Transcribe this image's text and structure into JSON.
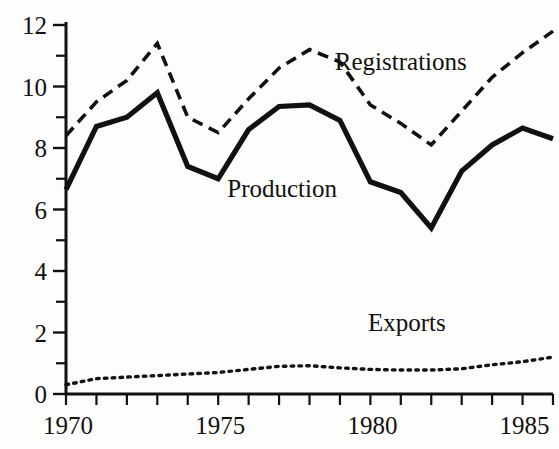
{
  "chart_data": {
    "type": "line",
    "title": "",
    "subtitle": "",
    "xlabel": "",
    "ylabel": "",
    "xlim": [
      1970,
      1986
    ],
    "ylim": [
      0,
      12
    ],
    "grid": false,
    "legend_position": "inline-annotations",
    "x": [
      1970,
      1971,
      1972,
      1973,
      1974,
      1975,
      1976,
      1977,
      1978,
      1979,
      1980,
      1981,
      1982,
      1983,
      1984,
      1985,
      1986
    ],
    "x_tick_values": [
      1970,
      1971,
      1972,
      1973,
      1974,
      1975,
      1976,
      1977,
      1978,
      1979,
      1980,
      1981,
      1982,
      1983,
      1984,
      1985,
      1986
    ],
    "x_tick_labels": [
      "1970",
      "",
      "",
      "",
      "",
      "1975",
      "",
      "",
      "",
      "",
      "1980",
      "",
      "",
      "",
      "",
      "1985",
      ""
    ],
    "x_major_labels": [
      "1970",
      "1975",
      "1980",
      "1985"
    ],
    "y_tick_values": [
      0,
      1,
      2,
      3,
      4,
      5,
      6,
      7,
      8,
      9,
      10,
      11,
      12
    ],
    "y_tick_labels": [
      "0",
      "",
      "2",
      "",
      "4",
      "",
      "6",
      "",
      "8",
      "",
      "10",
      "",
      "12"
    ],
    "y_major_labels": [
      "0",
      "2",
      "4",
      "6",
      "8",
      "10",
      "12"
    ],
    "series": [
      {
        "name": "Registrations",
        "style": "dashed",
        "label_x": 1981.0,
        "label_y": 10.55,
        "values": [
          8.4,
          9.5,
          10.2,
          11.4,
          9.0,
          8.5,
          9.6,
          10.6,
          11.2,
          10.8,
          9.4,
          8.8,
          8.1,
          9.2,
          10.3,
          11.1,
          11.8
        ]
      },
      {
        "name": "Production",
        "style": "solid",
        "label_x": 1977.1,
        "label_y": 6.4,
        "values": [
          6.65,
          8.7,
          9.0,
          9.8,
          7.4,
          7.0,
          8.6,
          9.35,
          9.4,
          8.9,
          6.9,
          6.55,
          5.4,
          7.25,
          8.1,
          8.65,
          8.3
        ]
      },
      {
        "name": "Exports",
        "style": "dotted",
        "label_x": 1981.2,
        "label_y": 2.05,
        "values": [
          0.3,
          0.5,
          0.55,
          0.6,
          0.65,
          0.7,
          0.8,
          0.9,
          0.92,
          0.85,
          0.8,
          0.78,
          0.78,
          0.82,
          0.95,
          1.05,
          1.2
        ]
      }
    ],
    "colors": {
      "ink": "#111111",
      "background": "#fdfdfb"
    }
  },
  "annotations": {
    "registrations_label": "Registrations",
    "production_label": "Production",
    "exports_label": "Exports"
  }
}
